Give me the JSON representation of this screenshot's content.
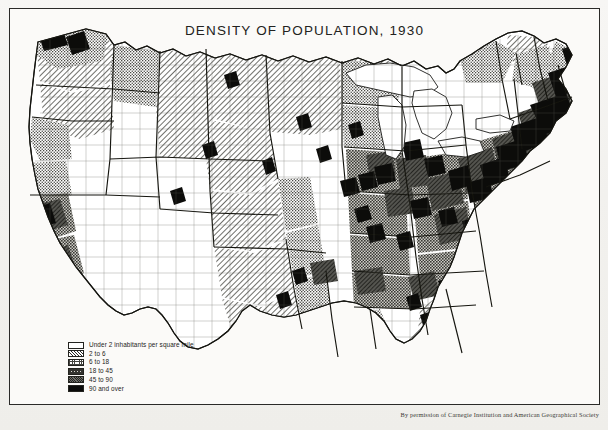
{
  "title": "DENSITY OF POPULATION, 1930",
  "credit": "By permission of Carnegie Institution and American Geographical Society",
  "legend": {
    "title": "",
    "items": [
      {
        "label": "Under 2 inhabitants per square mile",
        "class": "under-2",
        "swatch": "white"
      },
      {
        "label": "2 to 6",
        "class": "2-to-6",
        "swatch": "diagonal-hatch"
      },
      {
        "label": "6 to 18",
        "class": "6-to-18",
        "swatch": "fine-stipple"
      },
      {
        "label": "18 to 45",
        "class": "18-to-45",
        "swatch": "cross-hatch"
      },
      {
        "label": "45 to 90",
        "class": "45-to-90",
        "swatch": "dark-gray-hatch"
      },
      {
        "label": "90 and over",
        "class": "90-and-over",
        "swatch": "solid-black"
      }
    ]
  },
  "map": {
    "name": "united-states-population-density-1930",
    "projection": "albers-conic",
    "colors": {
      "under_2": "#ffffff",
      "class_2_6": "#e3e2dd",
      "class_6_18": "#c9c8c2",
      "class_18_45": "#a6a59f",
      "class_45_90": "#6e6e68",
      "class_90_over": "#0b0b0a",
      "water": "#ffffff",
      "outline": "#1b1b18",
      "state_border": "#15150f"
    },
    "water_bodies": [
      "Lake Superior",
      "Lake Michigan",
      "Lake Huron",
      "Lake Erie",
      "Lake Ontario"
    ],
    "regions": [
      {
        "name": "Pacific Northwest",
        "dominant_class": "6 to 18"
      },
      {
        "name": "California Coast",
        "dominant_class": "18 to 45"
      },
      {
        "name": "Great Basin",
        "dominant_class": "Under 2 inhabitants per square mile"
      },
      {
        "name": "Great Plains",
        "dominant_class": "2 to 6"
      },
      {
        "name": "Corn Belt",
        "dominant_class": "18 to 45"
      },
      {
        "name": "Northeast Megalopolis",
        "dominant_class": "90 and over"
      },
      {
        "name": "Southeast",
        "dominant_class": "18 to 45"
      },
      {
        "name": "Florida Peninsula",
        "dominant_class": "2 to 6"
      },
      {
        "name": "Texas",
        "dominant_class": "6 to 18"
      }
    ]
  }
}
